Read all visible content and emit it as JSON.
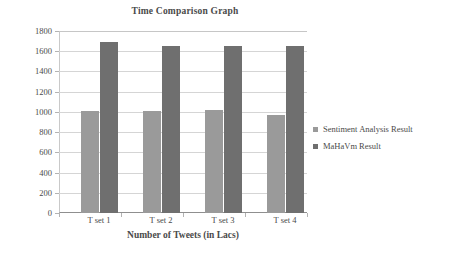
{
  "chart_data": {
    "type": "bar",
    "title": "Time Comparison Graph",
    "xlabel": "Number of Tweets (in Lacs)",
    "ylabel": "",
    "categories": [
      "T set 1",
      "T set 2",
      "T set 3",
      "T set 4"
    ],
    "series": [
      {
        "name": "Sentiment Analysis Result",
        "color": "#9a9a9a",
        "values": [
          1010,
          1012,
          1020,
          968
        ]
      },
      {
        "name": "MaHaVm Result",
        "color": "#6f6f6f",
        "values": [
          1690,
          1650,
          1656,
          1652
        ]
      }
    ],
    "ylim": [
      0,
      1800
    ],
    "yticks": [
      1800,
      1600,
      1400,
      1200,
      1000,
      800,
      600,
      400,
      200,
      0
    ],
    "ytick_labels": [
      "1800",
      "1600",
      "1400",
      "1200",
      "1000",
      "800",
      "600",
      "400",
      "200",
      "0"
    ],
    "grid": true,
    "legend_position": "right",
    "background": "#ffffff",
    "axis_color": "#8f8f8f",
    "grid_color": "#d5d5d5",
    "text_color": "#4a4a4a"
  }
}
